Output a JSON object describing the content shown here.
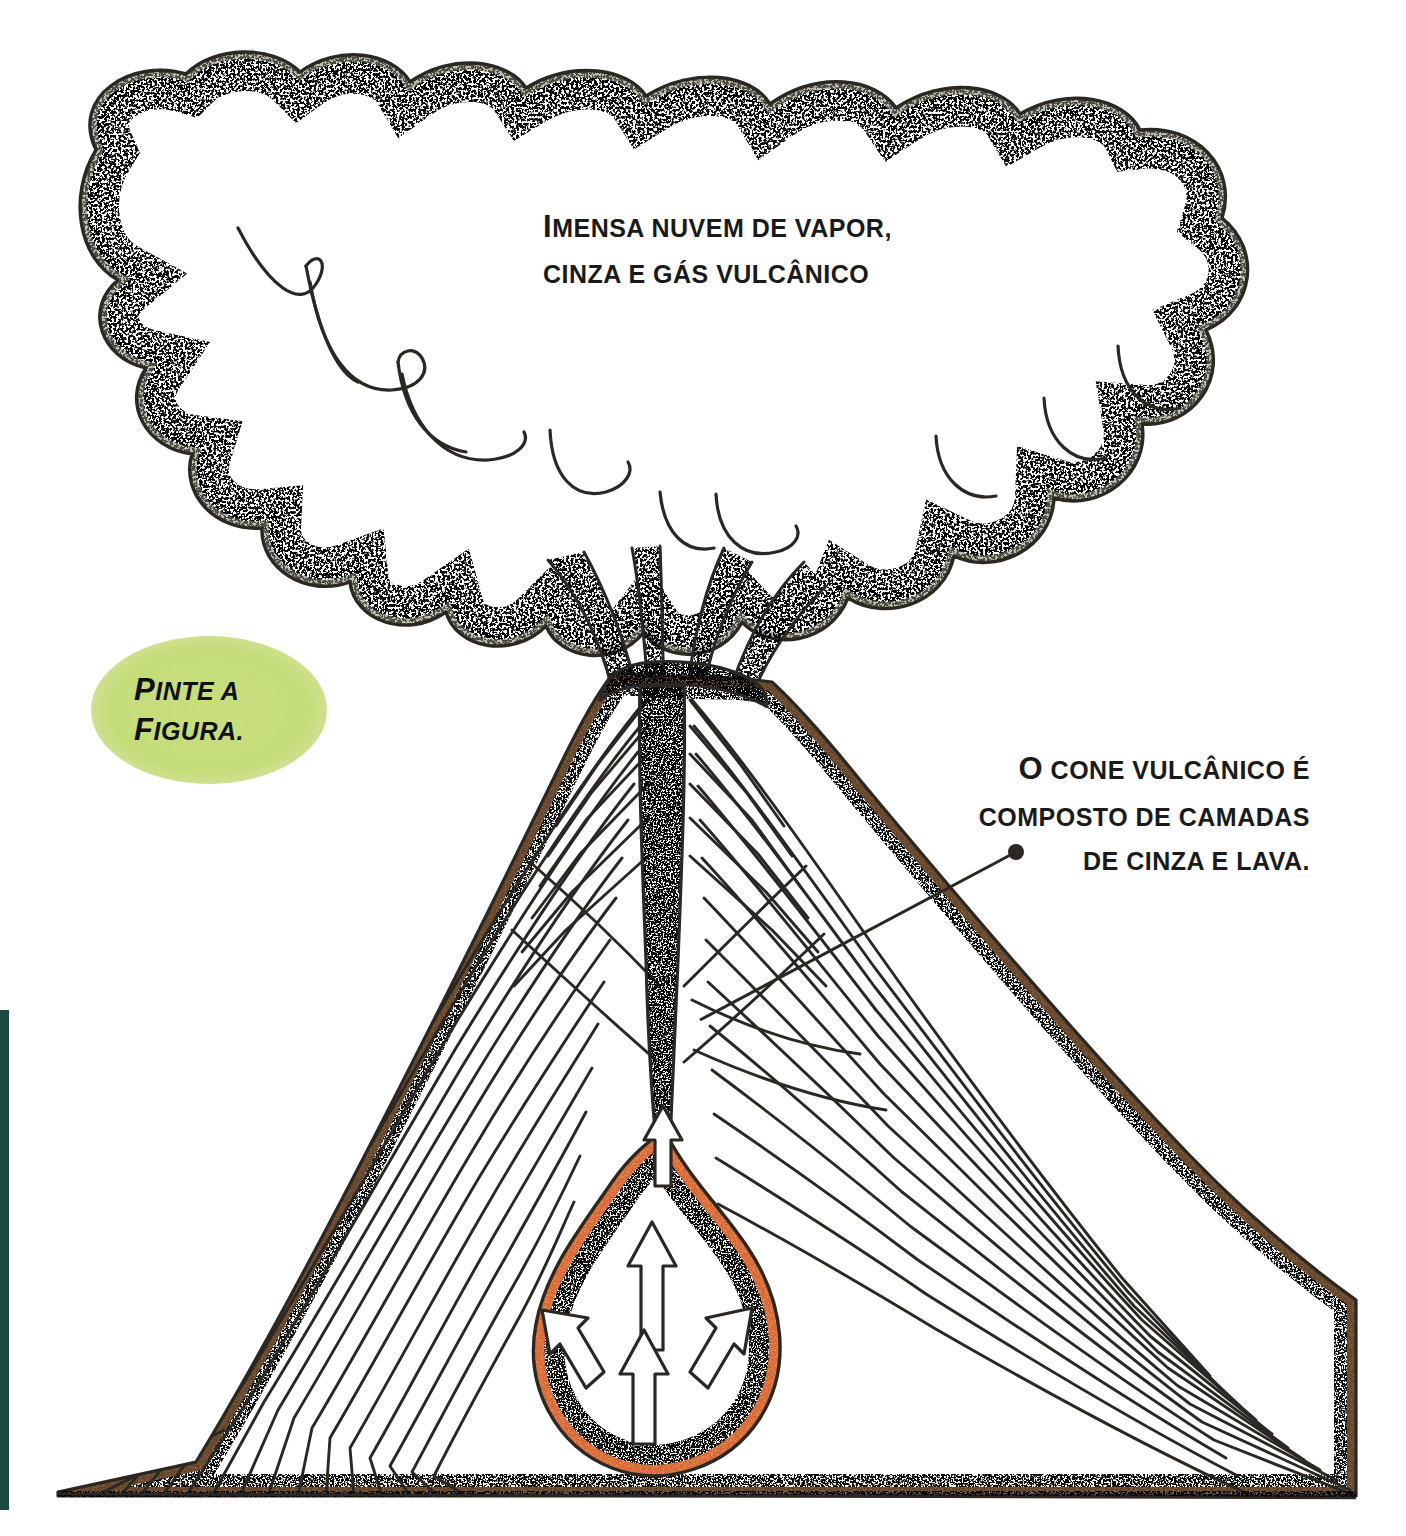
{
  "page": {
    "background_color": "#ffffff",
    "width": 1406,
    "height": 1536
  },
  "colors": {
    "ink": "#231f1c",
    "cloud_stipple": "#8b8977",
    "cone_crust": "#6b4a2c",
    "cone_crust_light": "#a08a63",
    "lava_orange": "#e8763c",
    "lava_orange_light": "#f0a070",
    "bubble_green": "#c5dc7a",
    "page_edge_teal": "#1e4a44"
  },
  "annotations": {
    "cloud_caption": {
      "name": "cloud-caption",
      "line1_lead": "I",
      "line1_rest": "MENSA NUVEM DE VAPOR,",
      "line2_lead": "",
      "line2_rest": "CINZA E GÁS VULCÂNICO",
      "full_text": "Imensa nuvem de vapor, cinza e gás vulcânico"
    },
    "cone_caption": {
      "name": "cone-caption",
      "line1_lead": "O",
      "line1_rest": " CONE VULCÂNICO É",
      "line2_rest": "COMPOSTO DE CAMADAS",
      "line3_rest": "DE CINZA E LAVA.",
      "full_text": "O cone vulcânico é composto de camadas de cinza e lava."
    },
    "paint_instruction": {
      "name": "paint-instruction-bubble",
      "line1_lead": "P",
      "line1_rest": "INTE A",
      "line2_lead": "F",
      "line2_rest": "IGURA.",
      "full_text": "Pinte a figura."
    }
  },
  "diagram": {
    "type": "cross-section-illustration",
    "parts": [
      {
        "name": "eruption-cloud",
        "label": "Imensa nuvem de vapor, cinza e gás vulcânico",
        "fill": "white",
        "edge": "stippled grey scalloped lobes"
      },
      {
        "name": "smoke-plumes",
        "label": "plumas de fumaça saindo da cratera",
        "count": 4
      },
      {
        "name": "volcanic-cone",
        "label": "cone vulcânico",
        "edge": "brown stippled crust"
      },
      {
        "name": "ash-lava-layers",
        "label": "camadas de cinza e lava",
        "line_count": 34
      },
      {
        "name": "volcanic-conduit",
        "label": "conduto / chaminé vulcânica",
        "fill": "#e8763c"
      },
      {
        "name": "magma-chamber",
        "label": "câmara magmática",
        "shape": "teardrop",
        "fill": "white with orange stippled rim"
      },
      {
        "name": "magma-flow-arrows",
        "label": "setas de fluxo do magma",
        "count": 4,
        "directions": [
          "up",
          "up",
          "up-left",
          "up-right"
        ]
      },
      {
        "name": "ground-line",
        "label": "linha do solo",
        "style": "brown stippled band"
      }
    ],
    "leader_line": {
      "name": "cone-caption-leader",
      "from": [
        1016,
        852
      ],
      "to": [
        700,
        1020
      ],
      "dot_end": "from"
    }
  }
}
